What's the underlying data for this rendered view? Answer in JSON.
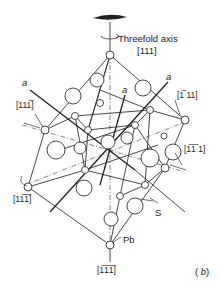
{
  "diagram": {
    "title": "Threefold axis",
    "axis_top_label": "[111]",
    "lattice_labels": [
      "a",
      "a",
      "a"
    ],
    "direction_labels": {
      "upper_left": "[111̅]",
      "lower_left": "[11̅1̅]",
      "upper_right": "[1̅ 11]",
      "lower_right": "[1̅1̅ 1]",
      "bottom": "[1̅1̅1̅]"
    },
    "atom_labels": {
      "sulfur": "S",
      "lead": "Pb"
    },
    "panel_label": "(b)"
  }
}
